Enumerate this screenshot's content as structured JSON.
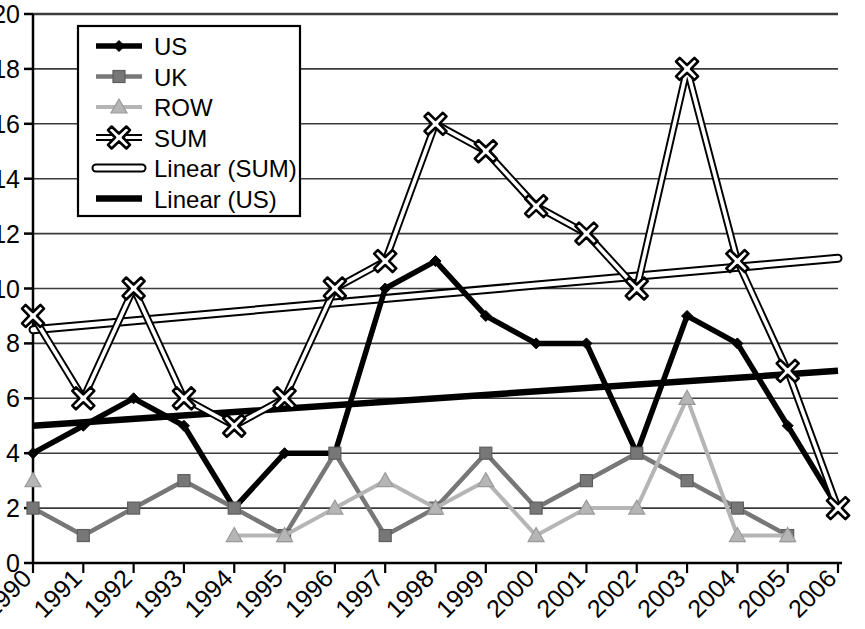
{
  "chart_data": {
    "type": "line",
    "title": "",
    "xlabel": "",
    "ylabel": "",
    "grid": "horizontal",
    "legend_position": "top-left-inside",
    "xlim": [
      1990,
      2006
    ],
    "ylim": [
      0,
      20
    ],
    "ytick_step": 2,
    "ytick_labels": [
      "0",
      "2",
      "4",
      "6",
      "8",
      "10",
      "12",
      "14",
      "16",
      "18",
      "20"
    ],
    "ytick_values": [
      0,
      2,
      4,
      6,
      8,
      10,
      12,
      14,
      16,
      18,
      20
    ],
    "categories": [
      "1990",
      "1991",
      "1992",
      "1993",
      "1994",
      "1995",
      "1996",
      "1997",
      "1998",
      "1999",
      "2000",
      "2001",
      "2002",
      "2003",
      "2004",
      "2005",
      "2006"
    ],
    "x": [
      1990,
      1991,
      1992,
      1993,
      1994,
      1995,
      1996,
      1997,
      1998,
      1999,
      2000,
      2001,
      2002,
      2003,
      2004,
      2005,
      2006
    ],
    "series": [
      {
        "name": "US",
        "marker": "diamond",
        "color": "#000000",
        "values": [
          4,
          5,
          6,
          5,
          2,
          4,
          4,
          1,
          null,
          null,
          null,
          null,
          null,
          null,
          null,
          null,
          null
        ],
        "values_full": [
          4,
          5,
          6,
          5,
          2,
          4,
          4,
          10,
          11,
          9,
          8,
          8,
          4,
          9,
          8,
          5,
          2
        ]
      },
      {
        "name": "UK",
        "marker": "square",
        "color": "#777777",
        "values": [
          2,
          1,
          2,
          3,
          2,
          1,
          4,
          1,
          2,
          4,
          2,
          3,
          4,
          3,
          2,
          1,
          null
        ]
      },
      {
        "name": "ROW",
        "marker": "triangle",
        "color": "#b5b5b5",
        "values": [
          3,
          null,
          null,
          null,
          1,
          1,
          2,
          3,
          2,
          3,
          1,
          2,
          2,
          6,
          1,
          1,
          null
        ]
      },
      {
        "name": "SUM",
        "marker": "cross",
        "color": "#000000",
        "values": [
          9,
          6,
          10,
          6,
          5,
          6,
          10,
          11,
          16,
          15,
          13,
          12,
          10,
          18,
          11,
          7,
          2
        ]
      }
    ],
    "trendlines": [
      {
        "name": "Linear (SUM)",
        "style": "hollow-thin",
        "color": "#000000",
        "x0": 1990,
        "y0": 8.5,
        "x1": 2006,
        "y1": 11.1
      },
      {
        "name": "Linear (US)",
        "style": "solid-thick",
        "color": "#000000",
        "x0": 1990,
        "y0": 5.0,
        "x1": 2006,
        "y1": 7.0
      }
    ],
    "legend_entries": [
      {
        "label": "US",
        "kind": "marker-line",
        "marker": "diamond",
        "color": "#000000"
      },
      {
        "label": "UK",
        "kind": "marker-line",
        "marker": "square",
        "color": "#777777"
      },
      {
        "label": "ROW",
        "kind": "marker-line",
        "marker": "triangle",
        "color": "#b5b5b5"
      },
      {
        "label": "SUM",
        "kind": "marker-line",
        "marker": "cross",
        "color": "#000000"
      },
      {
        "label": "Linear (SUM)",
        "kind": "hollow-line",
        "marker": "none",
        "color": "#000000"
      },
      {
        "label": "Linear (US)",
        "kind": "thick-line",
        "marker": "none",
        "color": "#000000"
      }
    ]
  }
}
